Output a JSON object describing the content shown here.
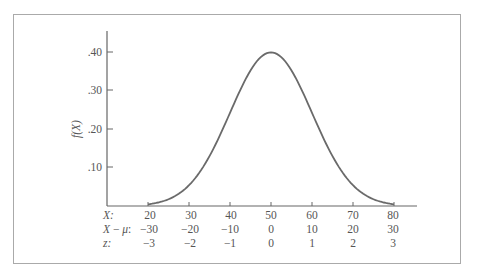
{
  "chart_data": {
    "type": "line",
    "title": "",
    "ylabel": "f(X)",
    "xlabel": "",
    "ylim": [
      0,
      0.45
    ],
    "y_ticks": [
      ".10",
      ".20",
      ".30",
      ".40"
    ],
    "x_rows": [
      {
        "label": "X:",
        "values": [
          "20",
          "30",
          "40",
          "50",
          "60",
          "70",
          "80"
        ]
      },
      {
        "label": "X − μ:",
        "values": [
          "−30",
          "−20",
          "−10",
          "0",
          "10",
          "20",
          "30"
        ]
      },
      {
        "label": "z:",
        "values": [
          "−3",
          "−2",
          "−1",
          "0",
          "1",
          "2",
          "3"
        ]
      }
    ],
    "mean": 50,
    "sd": 10,
    "x": [
      20,
      25,
      30,
      35,
      40,
      45,
      50,
      55,
      60,
      65,
      70,
      75,
      80
    ],
    "values": [
      0.0044,
      0.0175,
      0.054,
      0.1295,
      0.242,
      0.352,
      0.399,
      0.352,
      0.242,
      0.1295,
      0.054,
      0.0175,
      0.0044
    ],
    "grid": false,
    "legend": null
  },
  "labels": {
    "ylabel_f": "f",
    "ylabel_arg": "(X)",
    "ytick_10": ".10",
    "ytick_20": ".20",
    "ytick_30": ".30",
    "ytick_40": ".40",
    "row_x": "X:",
    "row_xmu_x": "X",
    "row_xmu_minus": " − ",
    "row_xmu_mu": "μ",
    "row_xmu_colon": ":",
    "row_z": "z:",
    "x_vals": [
      "20",
      "30",
      "40",
      "50",
      "60",
      "70",
      "80"
    ],
    "xmu_vals": [
      "−30",
      "−20",
      "−10",
      "0",
      "10",
      "20",
      "30"
    ],
    "z_vals": [
      "−3",
      "−2",
      "−1",
      "0",
      "1",
      "2",
      "3"
    ]
  }
}
